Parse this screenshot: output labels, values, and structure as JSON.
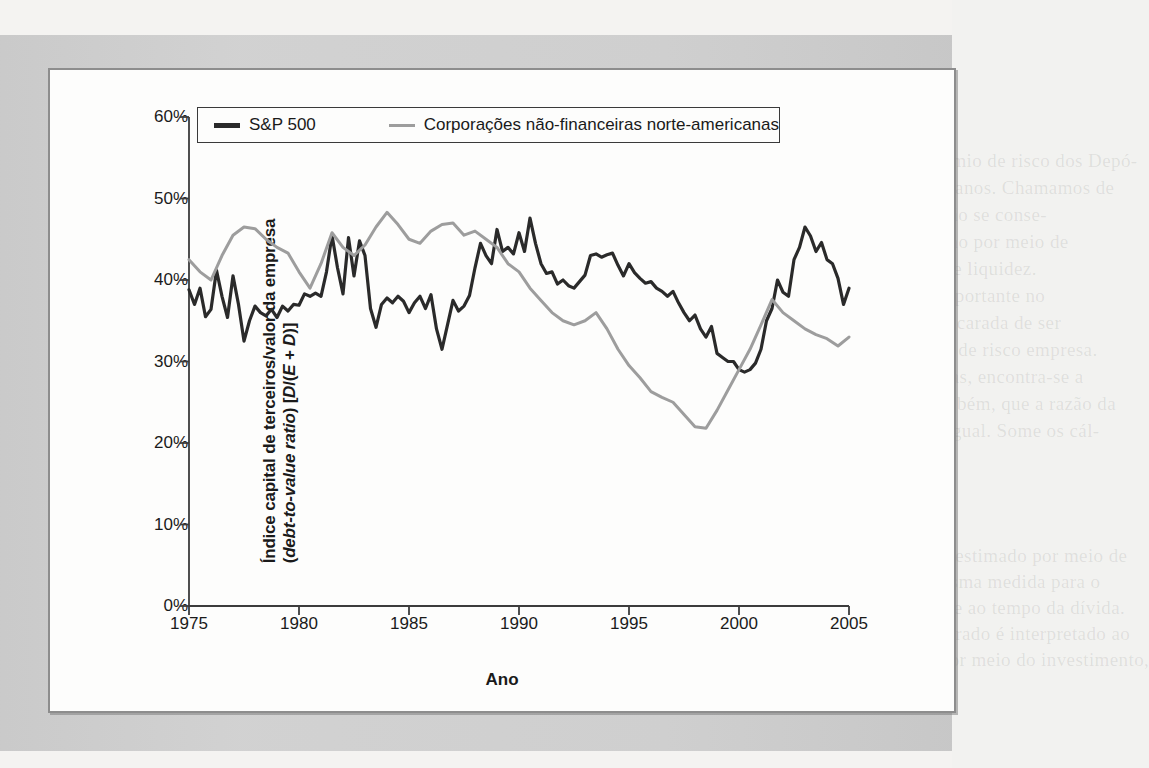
{
  "page": {
    "background_color": "#f4f3f1",
    "band_color": "#cfcfcf",
    "panel_color": "#fdfdfc",
    "bleed_lines_top": [
      "ordem de 7% a 8% ao ano. Historicamente, o prêmio de risco dos Depó-",
      "sitos financeiros é de 5% sobre os 1.000 últimos anos. Chamamos de",
      "premiação dos investidores, no entanto. 1000, não se conse-",
      "guiu, no entanto, não se consegue obter um retorno por meio de",
      "sua aceitação, em virtude da inflação e da falta de liquidez.",
      "Os números encontrados presentes tornam-se importante no",
      "custo de ações tributárias. Como a empresa foi encarada de ser",
      "custo a nível real, não se avalia no ajuste da taxa de risco empresa.",
      "Pela avaliação de ações das empresas estrangeiras, encontra-se a",
      "diante representada no [D/(E + D)]. Resta-se, também, que a razão da",
      "dívida/financiamento, é aqui indicada de forma igual. Some os cál-"
    ],
    "bleed_lines_bottom": [
      "Observa-se, ainda, que o retorno de ações pode ser estimado por meio de",
      "uma adaptação, a qual é feita em torno de uma mesma medida para o",
      "denominador, a partir de uma ponderação referente ao tempo da dívida.",
      "Observe que este caso em que o custo médio ponderado é interpretado ao",
      "custo marginal esperado. Dada a taxa de retorno por meio do investimento,",
      "por exemplo, ao lado de uma avaliação."
    ]
  },
  "chart_data": {
    "type": "line",
    "title": "",
    "xlabel": "Ano",
    "ylabel_line1": "Índice capital de terceiros/valor da empresa",
    "ylabel_line2_pre": "(",
    "ylabel_line2_italic": "debt-to-value ratio",
    "ylabel_line2_post": ") [",
    "ylabel_line2_italic2": "D",
    "ylabel_line2_mid": "/(",
    "ylabel_line2_italic3": "E + D",
    "ylabel_line2_end": ")]",
    "xlim": [
      1975,
      2005
    ],
    "ylim": [
      0,
      60
    ],
    "grid": false,
    "legend_position": "top-inside",
    "ytick_labels": [
      "60%",
      "50%",
      "40%",
      "30%",
      "20%",
      "10%",
      "0%"
    ],
    "ytick_values": [
      60,
      50,
      40,
      30,
      20,
      10,
      0
    ],
    "xtick_labels": [
      "1975",
      "1980",
      "1985",
      "1990",
      "1995",
      "2000",
      "2005"
    ],
    "xtick_values": [
      1975,
      1980,
      1985,
      1990,
      1995,
      2000,
      2005
    ],
    "series": [
      {
        "name": "S&P 500",
        "color": "#2a2a2a",
        "width": 3.2,
        "x": [
          1975.0,
          1975.25,
          1975.5,
          1975.75,
          1976.0,
          1976.25,
          1976.5,
          1976.75,
          1977.0,
          1977.25,
          1977.5,
          1977.75,
          1978.0,
          1978.25,
          1978.5,
          1978.75,
          1979.0,
          1979.25,
          1979.5,
          1979.75,
          1980.0,
          1980.25,
          1980.5,
          1980.75,
          1981.0,
          1981.25,
          1981.5,
          1981.75,
          1982.0,
          1982.25,
          1982.5,
          1982.75,
          1983.0,
          1983.25,
          1983.5,
          1983.75,
          1984.0,
          1984.25,
          1984.5,
          1984.75,
          1985.0,
          1985.25,
          1985.5,
          1985.75,
          1986.0,
          1986.25,
          1986.5,
          1986.75,
          1987.0,
          1987.25,
          1987.5,
          1987.75,
          1988.0,
          1988.25,
          1988.5,
          1988.75,
          1989.0,
          1989.25,
          1989.5,
          1989.75,
          1990.0,
          1990.25,
          1990.5,
          1990.75,
          1991.0,
          1991.25,
          1991.5,
          1991.75,
          1992.0,
          1992.25,
          1992.5,
          1992.75,
          1993.0,
          1993.25,
          1993.5,
          1993.75,
          1994.0,
          1994.25,
          1994.5,
          1994.75,
          1995.0,
          1995.25,
          1995.5,
          1995.75,
          1996.0,
          1996.25,
          1996.5,
          1996.75,
          1997.0,
          1997.25,
          1997.5,
          1997.75,
          1998.0,
          1998.25,
          1998.5,
          1998.75,
          1999.0,
          1999.25,
          1999.5,
          1999.75,
          2000.0,
          2000.25,
          2000.5,
          2000.75,
          2001.0,
          2001.25,
          2001.5,
          2001.75,
          2002.0,
          2002.25,
          2002.5,
          2002.75,
          2003.0,
          2003.25,
          2003.5,
          2003.75,
          2004.0,
          2004.25,
          2004.5,
          2004.75,
          2005.0
        ],
        "y": [
          38.8,
          37.0,
          39.0,
          35.5,
          36.4,
          41.2,
          38.0,
          35.4,
          40.5,
          37.0,
          32.5,
          35.0,
          36.8,
          36.0,
          35.6,
          36.4,
          35.4,
          36.8,
          36.2,
          37.0,
          36.9,
          38.3,
          38.0,
          38.4,
          38.0,
          41.0,
          45.5,
          41.5,
          38.3,
          45.2,
          40.5,
          44.8,
          43.0,
          36.5,
          34.2,
          37.0,
          37.8,
          37.2,
          38.0,
          37.4,
          36.0,
          37.2,
          38.0,
          36.5,
          38.2,
          34.0,
          31.5,
          34.5,
          37.5,
          36.2,
          36.8,
          38.1,
          41.5,
          44.5,
          43.0,
          42.0,
          46.2,
          43.5,
          44.0,
          43.2,
          45.8,
          43.5,
          47.6,
          44.5,
          42.0,
          40.8,
          41.0,
          39.5,
          40.0,
          39.3,
          39.0,
          39.8,
          40.6,
          43.0,
          43.2,
          42.8,
          43.1,
          43.3,
          41.8,
          40.5,
          42.0,
          40.9,
          40.2,
          39.6,
          39.8,
          39.0,
          38.6,
          38.0,
          38.6,
          37.2,
          36.0,
          35.0,
          35.7,
          34.0,
          33.0,
          34.3,
          31.0,
          30.5,
          30.0,
          30.0,
          29.0,
          28.7,
          29.0,
          29.8,
          31.5,
          35.0,
          36.5,
          40.0,
          38.5,
          38.0,
          42.5,
          44.0,
          46.5,
          45.4,
          43.5,
          44.6,
          42.5,
          42.0,
          40.2,
          37.0,
          39.0
        ]
      },
      {
        "name": "Corporações não-financeiras norte-americanas",
        "color": "#9d9d9d",
        "width": 3.0,
        "x": [
          1975.0,
          1975.5,
          1976.0,
          1976.5,
          1977.0,
          1977.5,
          1978.0,
          1978.5,
          1979.0,
          1979.5,
          1980.0,
          1980.5,
          1981.0,
          1981.5,
          1982.0,
          1982.5,
          1983.0,
          1983.5,
          1984.0,
          1984.5,
          1985.0,
          1985.5,
          1986.0,
          1986.5,
          1987.0,
          1987.5,
          1988.0,
          1988.5,
          1989.0,
          1989.5,
          1990.0,
          1990.5,
          1991.0,
          1991.5,
          1992.0,
          1992.5,
          1993.0,
          1993.5,
          1994.0,
          1994.5,
          1995.0,
          1995.5,
          1996.0,
          1996.5,
          1997.0,
          1997.5,
          1998.0,
          1998.5,
          1999.0,
          1999.5,
          2000.0,
          2000.5,
          2001.0,
          2001.5,
          2002.0,
          2002.5,
          2003.0,
          2003.5,
          2004.0,
          2004.5,
          2005.0
        ],
        "y": [
          42.5,
          41.0,
          40.0,
          43.0,
          45.5,
          46.5,
          46.3,
          45.0,
          44.0,
          43.3,
          41.0,
          39.0,
          42.0,
          45.8,
          44.0,
          43.0,
          44.3,
          46.5,
          48.3,
          46.8,
          45.0,
          44.5,
          46.0,
          46.8,
          47.0,
          45.5,
          46.0,
          45.0,
          44.0,
          42.0,
          41.0,
          39.0,
          37.5,
          36.0,
          35.0,
          34.5,
          35.0,
          36.0,
          34.0,
          31.5,
          29.5,
          28.0,
          26.3,
          25.6,
          25.0,
          23.5,
          22.0,
          21.8,
          24.0,
          26.5,
          29.0,
          31.5,
          34.5,
          37.6,
          36.0,
          35.0,
          34.0,
          33.3,
          32.8,
          31.9,
          33.0
        ]
      }
    ]
  }
}
